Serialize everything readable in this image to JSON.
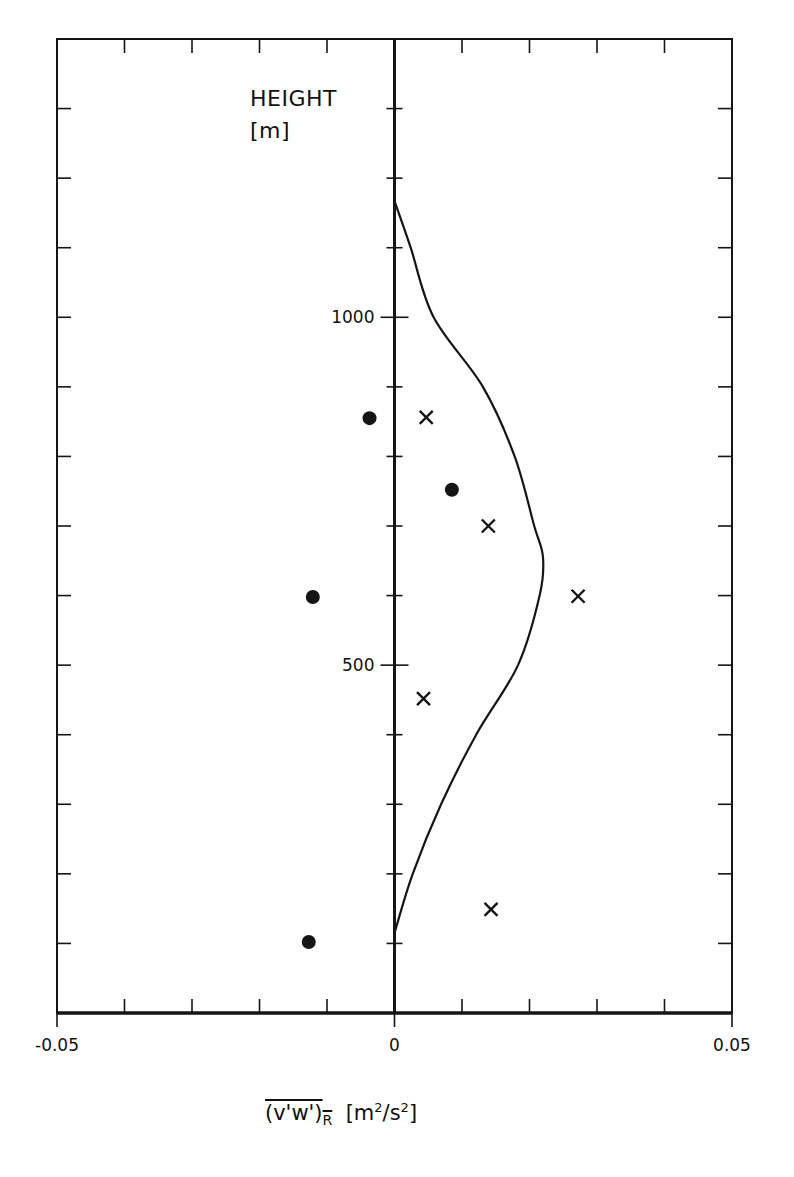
{
  "chart_data": {
    "type": "scatter",
    "title": "",
    "ylabel": "HEIGHT",
    "ylabel_unit": "[m]",
    "xlabel_main": "(v'w')",
    "xlabel_sub": "R",
    "xlabel_unit_pre": "[m",
    "xlabel_unit_mid": "/s",
    "xlabel_unit_post": "]",
    "xlabel_exp": "2",
    "xlim": [
      -0.05,
      0.05
    ],
    "ylim": [
      0,
      1400
    ],
    "x_ticks": [
      -0.05,
      -0.04,
      -0.03,
      -0.02,
      -0.01,
      0,
      0.01,
      0.02,
      0.03,
      0.04,
      0.05
    ],
    "x_tick_labels": [
      {
        "value": -0.05,
        "label": "-0.05"
      },
      {
        "value": 0,
        "label": "0"
      },
      {
        "value": 0.05,
        "label": "0.05"
      }
    ],
    "y_ticks": [
      100,
      200,
      300,
      400,
      500,
      600,
      700,
      800,
      900,
      1000,
      1100,
      1200,
      1300
    ],
    "y_tick_labels": [
      {
        "value": 1000,
        "label": "1000"
      },
      {
        "value": 500,
        "label": "500"
      }
    ],
    "grid": false,
    "legend": null,
    "series": [
      {
        "name": "dots",
        "marker": "filled-circle",
        "points": [
          {
            "x": -0.0037,
            "y": 855
          },
          {
            "x": 0.0085,
            "y": 752
          },
          {
            "x": -0.0121,
            "y": 598
          },
          {
            "x": -0.0127,
            "y": 102
          }
        ]
      },
      {
        "name": "crosses",
        "marker": "x",
        "points": [
          {
            "x": 0.0047,
            "y": 856
          },
          {
            "x": 0.0139,
            "y": 700
          },
          {
            "x": 0.0272,
            "y": 599
          },
          {
            "x": 0.0043,
            "y": 452
          },
          {
            "x": 0.0143,
            "y": 149
          }
        ]
      },
      {
        "name": "model-curve",
        "type": "line",
        "points": [
          {
            "x": 0,
            "y": 1167
          },
          {
            "x": 0.0024,
            "y": 1100
          },
          {
            "x": 0.0058,
            "y": 1000
          },
          {
            "x": 0.0131,
            "y": 900
          },
          {
            "x": 0.0178,
            "y": 800
          },
          {
            "x": 0.0207,
            "y": 700
          },
          {
            "x": 0.022,
            "y": 655
          },
          {
            "x": 0.0215,
            "y": 600
          },
          {
            "x": 0.0183,
            "y": 500
          },
          {
            "x": 0.0121,
            "y": 400
          },
          {
            "x": 0.0069,
            "y": 300
          },
          {
            "x": 0.0027,
            "y": 200
          },
          {
            "x": 0,
            "y": 115
          }
        ]
      }
    ]
  }
}
